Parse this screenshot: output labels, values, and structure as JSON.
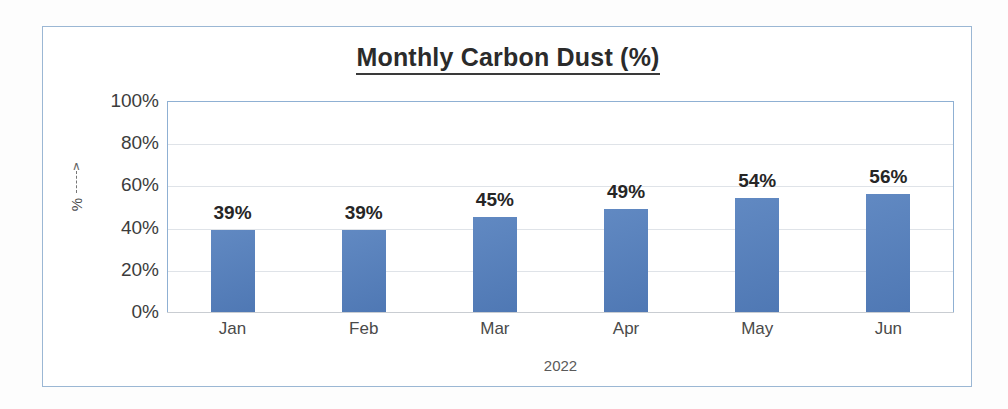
{
  "chart_data": {
    "type": "bar",
    "title": "Monthly Carbon Dust (%)",
    "xlabel": "2022",
    "ylabel": "%",
    "categories": [
      "Jan",
      "Feb",
      "Mar",
      "Apr",
      "May",
      "Jun"
    ],
    "values": [
      39,
      39,
      45,
      49,
      54,
      56
    ],
    "data_labels": [
      "39%",
      "39%",
      "45%",
      "49%",
      "54%",
      "56%"
    ],
    "ylim": [
      0,
      100
    ],
    "y_tick_labels": [
      "100%",
      "80%",
      "60%",
      "40%",
      "20%",
      "0%"
    ],
    "y_tick_values": [
      100,
      80,
      60,
      40,
      20,
      0
    ],
    "grid": true,
    "legend": false,
    "series": [
      {
        "name": "Carbon Dust",
        "values": [
          39,
          39,
          45,
          49,
          54,
          56
        ]
      }
    ],
    "colors": {
      "bar": "#5a82bd",
      "plot_border": "#8fb0d3",
      "frame_border": "#9bb7d4",
      "gridline": "#dfe3e8",
      "title_text": "#2b2b2b",
      "label_text": "#262626",
      "background": "#ffffff"
    }
  },
  "axis": {
    "y_arrow_glyph": "∧"
  }
}
